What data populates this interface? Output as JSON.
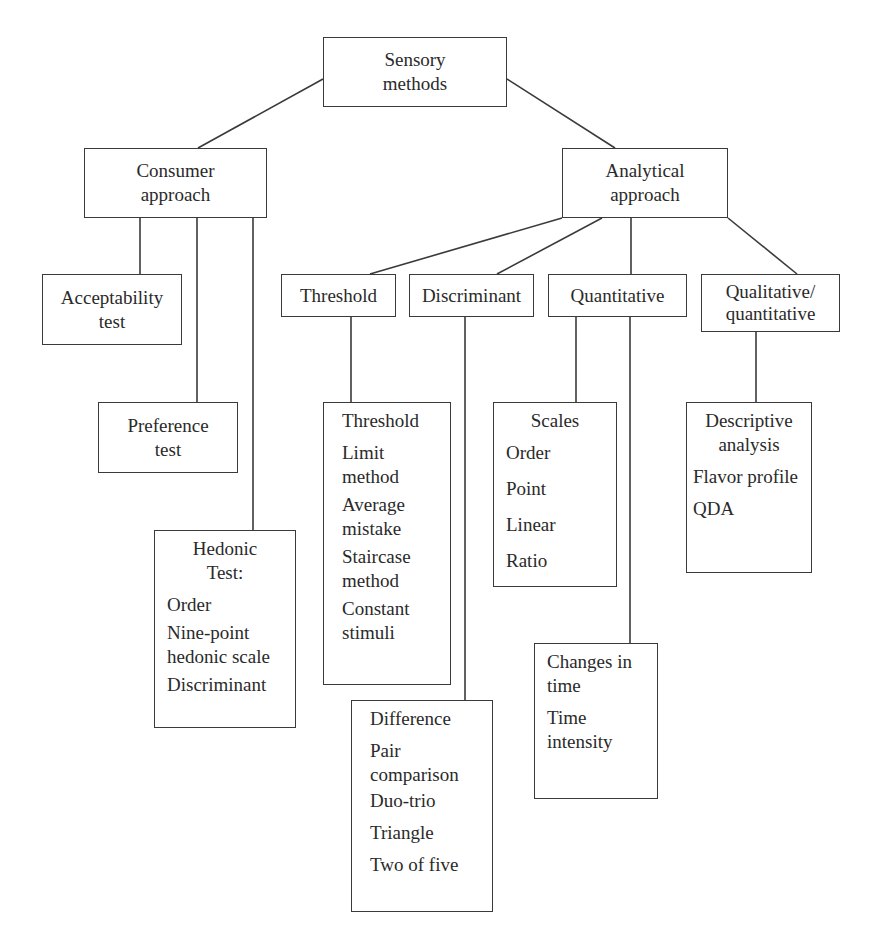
{
  "diagram": {
    "type": "hierarchy",
    "root": {
      "id": "sensory",
      "label": "Sensory\nmethods"
    },
    "approaches": {
      "consumer": {
        "label": "Consumer\napproach",
        "children": {
          "acceptability": {
            "label": "Acceptability\ntest"
          },
          "preference": {
            "label": "Preference\ntest"
          },
          "hedonic": {
            "title": "Hedonic\nTest:",
            "items": [
              "Order",
              "Nine-point\nhedonic scale",
              "Discriminant"
            ]
          }
        }
      },
      "analytical": {
        "label": "Analytical\napproach",
        "children": {
          "threshold": {
            "label": "Threshold",
            "detail": {
              "title": "Threshold",
              "items": [
                "Limit\nmethod",
                "Average\nmistake",
                "Staircase\nmethod",
                "Constant\nstimuli"
              ]
            }
          },
          "discriminant": {
            "label": "Discriminant",
            "detail": {
              "title": "Difference",
              "items": [
                "Pair\ncomparison",
                "Duo-trio",
                "Triangle",
                "Two of five"
              ]
            }
          },
          "quantitative": {
            "label": "Quantitative",
            "scales": {
              "title": "Scales",
              "items": [
                "Order",
                "Point",
                "Linear",
                "Ratio"
              ]
            },
            "changes": {
              "title": "Changes in\ntime",
              "items": [
                "Time\nintensity"
              ]
            }
          },
          "qualitative": {
            "label": "Qualitative/\nquantitative",
            "detail": {
              "title": "Descriptive\nanalysis",
              "items": [
                "Flavor profile",
                "QDA"
              ]
            }
          }
        }
      }
    },
    "colors": {
      "line": "#3a3a3a",
      "text": "#2a2a2a",
      "background": "#ffffff"
    }
  }
}
